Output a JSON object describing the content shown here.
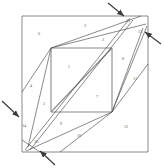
{
  "figure": {
    "type": "geometric-dissection-diagram",
    "canvas": {
      "width": 164,
      "height": 168
    },
    "colors": {
      "line": "#4a4a4a",
      "thick_line": "#8a8a8a",
      "label": "#5a5a5a",
      "background": "#ffffff",
      "arrow": "#3a3a3a"
    },
    "outer_square": {
      "x1": 22,
      "y1": 16,
      "x2": 148,
      "y2": 152
    },
    "inner_square": {
      "x1": 51,
      "y1": 48,
      "x2": 112,
      "y2": 112
    }
  },
  "regions": [
    {
      "id": "1",
      "label": "1",
      "x": 69,
      "y": 68
    },
    {
      "id": "2",
      "label": "2",
      "x": 103,
      "y": 41
    },
    {
      "id": "3",
      "label": "3",
      "x": 85,
      "y": 27
    },
    {
      "id": "4",
      "label": "4",
      "x": 31,
      "y": 87
    },
    {
      "id": "5",
      "label": "5",
      "x": 44,
      "y": 105
    },
    {
      "id": "6",
      "label": "6",
      "x": 39,
      "y": 35
    },
    {
      "id": "7",
      "label": "7",
      "x": 97,
      "y": 98
    },
    {
      "id": "8",
      "label": "8",
      "x": 123,
      "y": 60
    },
    {
      "id": "9",
      "label": "9",
      "x": 61,
      "y": 125
    },
    {
      "id": "10",
      "label": "10",
      "x": 79,
      "y": 137
    },
    {
      "id": "11",
      "label": "11",
      "x": 135,
      "y": 80
    },
    {
      "id": "12",
      "label": "12",
      "x": 126,
      "y": 128
    },
    {
      "id": "13",
      "label": "13",
      "x": 140,
      "y": 33
    },
    {
      "id": "14",
      "label": "14",
      "x": 24,
      "y": 127
    },
    {
      "id": "15",
      "label": "15",
      "x": 128,
      "y": 22
    },
    {
      "id": "16",
      "label": "16",
      "x": 36,
      "y": 143
    }
  ],
  "arrows": [
    {
      "id": "arrow-top",
      "name": "arrow-top-right-corner",
      "x1": 108,
      "y1": 3,
      "x2": 124,
      "y2": 16
    },
    {
      "id": "arrow-right",
      "name": "arrow-right-edge",
      "x1": 161,
      "y1": 44,
      "x2": 145,
      "y2": 32
    },
    {
      "id": "arrow-left",
      "name": "arrow-left-edge",
      "x1": 2,
      "y1": 101,
      "x2": 19,
      "y2": 117
    },
    {
      "id": "arrow-bottom",
      "name": "arrow-bottom-left-corner",
      "x1": 55,
      "y1": 165,
      "x2": 40,
      "y2": 151
    }
  ],
  "edges": [
    {
      "name": "outer-top",
      "x1": 22,
      "y1": 16,
      "x2": 148,
      "y2": 16
    },
    {
      "name": "outer-right",
      "x1": 148,
      "y1": 16,
      "x2": 148,
      "y2": 152
    },
    {
      "name": "outer-bottom",
      "x1": 148,
      "y1": 152,
      "x2": 22,
      "y2": 152
    },
    {
      "name": "outer-left",
      "x1": 22,
      "y1": 152,
      "x2": 22,
      "y2": 16
    },
    {
      "name": "inner-top",
      "x1": 51,
      "y1": 48,
      "x2": 112,
      "y2": 48
    },
    {
      "name": "inner-right",
      "x1": 112,
      "y1": 48,
      "x2": 112,
      "y2": 112
    },
    {
      "name": "inner-bottom",
      "x1": 112,
      "y1": 112,
      "x2": 51,
      "y2": 112
    },
    {
      "name": "inner-left",
      "x1": 51,
      "y1": 112,
      "x2": 51,
      "y2": 48
    },
    {
      "name": "inner-diagonal",
      "x1": 51,
      "y1": 112,
      "x2": 112,
      "y2": 48
    },
    {
      "name": "cut-a",
      "x1": 51,
      "y1": 48,
      "x2": 22,
      "y2": 92
    },
    {
      "name": "cut-b",
      "x1": 51,
      "y1": 48,
      "x2": 28,
      "y2": 147
    },
    {
      "name": "cut-c",
      "x1": 51,
      "y1": 48,
      "x2": 141,
      "y2": 16
    },
    {
      "name": "cut-d",
      "x1": 51,
      "y1": 48,
      "x2": 146,
      "y2": 24
    },
    {
      "name": "cut-e",
      "x1": 25,
      "y1": 150,
      "x2": 130,
      "y2": 18
    },
    {
      "name": "cut-f",
      "x1": 30,
      "y1": 150,
      "x2": 133,
      "y2": 20
    },
    {
      "name": "cut-g",
      "x1": 112,
      "y1": 112,
      "x2": 147,
      "y2": 26
    },
    {
      "name": "cut-h",
      "x1": 112,
      "y1": 112,
      "x2": 143,
      "y2": 28
    },
    {
      "name": "cut-i",
      "x1": 112,
      "y1": 112,
      "x2": 148,
      "y2": 64
    },
    {
      "name": "cut-j",
      "x1": 112,
      "y1": 112,
      "x2": 26,
      "y2": 151
    },
    {
      "name": "cut-k",
      "x1": 112,
      "y1": 112,
      "x2": 60,
      "y2": 152
    },
    {
      "name": "cut-l",
      "x1": 22,
      "y1": 140,
      "x2": 40,
      "y2": 152
    }
  ]
}
